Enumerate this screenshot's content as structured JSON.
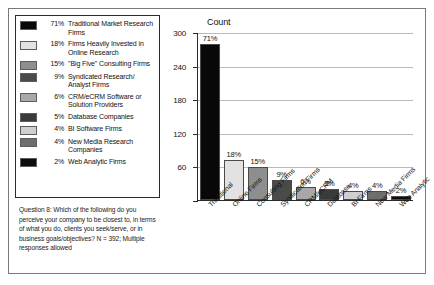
{
  "legend": {
    "items": [
      {
        "pct": "71%",
        "label": "Traditional Market Research Firms",
        "color": "#080808"
      },
      {
        "pct": "18%",
        "label": "Firms Heavily Invested in Online Research",
        "color": "#e2e2e2"
      },
      {
        "pct": "15%",
        "label": "\"Big Five\" Consulting Firms",
        "color": "#8e8e8e"
      },
      {
        "pct": "9%",
        "label": "Syndicated Research/ Analyst Firms",
        "color": "#4a4a4a"
      },
      {
        "pct": "6%",
        "label": "CRM/eCRM Software or Solution Providers",
        "color": "#a8a8a8"
      },
      {
        "pct": "5%",
        "label": "Database Companies",
        "color": "#3a3a3a"
      },
      {
        "pct": "4%",
        "label": "BI Software Firms",
        "color": "#cfcfcf"
      },
      {
        "pct": "4%",
        "label": "New Media Research Companies",
        "color": "#6e6e6e"
      },
      {
        "pct": "2%",
        "label": "Web Analytic Firms",
        "color": "#0d0d0d"
      }
    ]
  },
  "caption": {
    "text": "Question 8: Which of the following do you perceive your company to be closest to, in terms of what you do, clients you seek/serve, or in business goals/objectives? N = 392; Multiple responses allowed"
  },
  "chart_data": {
    "type": "bar",
    "title": "Count",
    "xlabel": "",
    "ylabel": "Count",
    "ylim": [
      0,
      300
    ],
    "yticks": [
      0,
      60,
      120,
      180,
      240,
      300
    ],
    "ytick_labels": [
      "",
      "60",
      "120",
      "180",
      "240",
      "300"
    ],
    "grid": true,
    "legend_position": "left-outside",
    "categories": [
      "Traditional",
      "Online Firms",
      "Consulting Firms",
      "Syndicated Firms",
      "CRM/eCRM",
      "Database",
      "BI Firms",
      "New Media Firms",
      "Web Analytic"
    ],
    "values": [
      278,
      71,
      59,
      35,
      24,
      20,
      16,
      16,
      8
    ],
    "data_labels": [
      "71%",
      "18%",
      "15%",
      "9%",
      "6%",
      "5%",
      "4%",
      "4%",
      "2%"
    ],
    "colors": [
      "#080808",
      "#e2e2e2",
      "#8e8e8e",
      "#4a4a4a",
      "#a8a8a8",
      "#3a3a3a",
      "#cfcfcf",
      "#6e6e6e",
      "#0d0d0d"
    ]
  }
}
